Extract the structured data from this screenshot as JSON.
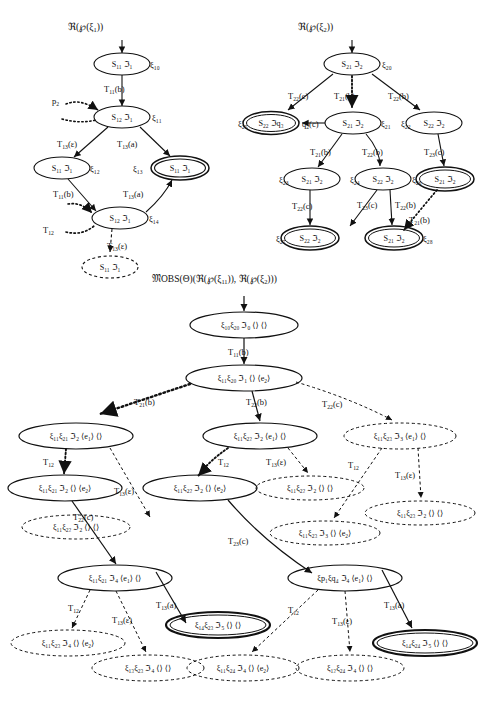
{
  "figure": {
    "kind": "three tree diagrams of labelled automaton states",
    "trees": [
      {
        "id": "tree-left",
        "title": "ℜ(℘(ξ1))",
        "nodes": [
          {
            "id": "L0",
            "text": "S11 ℑ1",
            "side": "ξ1₀",
            "style": "solid",
            "cx": 122,
            "cy": 64
          },
          {
            "id": "L1",
            "text": "S12 ℑ1",
            "side": "ξ1₁",
            "style": "solid",
            "cx": 122,
            "cy": 117
          },
          {
            "id": "L2",
            "text": "S11 ℑ1",
            "side": "ξ1₂",
            "style": "solid",
            "cx": 62,
            "cy": 168
          },
          {
            "id": "L3",
            "text": "S11 ℑ1",
            "side": "ξ1₃",
            "style": "double",
            "cx": 180,
            "cy": 168
          },
          {
            "id": "L4",
            "text": "S12 ℑ1",
            "side": "ξ1₄",
            "style": "solid",
            "cx": 120,
            "cy": 218
          },
          {
            "id": "L5",
            "text": "S11 ℑ1",
            "side": "",
            "style": "dashed",
            "cx": 110,
            "cy": 267
          }
        ],
        "edges": [
          {
            "from": "entry",
            "to": "L0",
            "label": "",
            "style": "solid"
          },
          {
            "from": "L0",
            "to": "L1",
            "label": "T11(b)",
            "style": "solid"
          },
          {
            "from": "L1",
            "to": "L2",
            "label": "T13(ε)",
            "style": "solid"
          },
          {
            "from": "L1",
            "to": "L3",
            "label": "T13(a)",
            "style": "solid"
          },
          {
            "from": "L2",
            "to": "L4",
            "label": "T11(b)",
            "style": "solid"
          },
          {
            "from": "L4",
            "to": "L3",
            "label": "T13(a)",
            "style": "solid"
          },
          {
            "from": "L4",
            "to": "L5",
            "label": "T13(ε)",
            "style": "dashed"
          },
          {
            "from": "p2",
            "to": "L1",
            "label": "p2",
            "style": "dotted"
          },
          {
            "from": "T12",
            "to": "L4",
            "label": "T12",
            "style": "dotted"
          }
        ]
      },
      {
        "id": "tree-right",
        "title": "ℜ(℘(ξ2))",
        "nodes": [
          {
            "id": "R0",
            "text": "S21 ℑ2",
            "side": "ξ2₀",
            "style": "solid",
            "cx": 352,
            "cy": 64
          },
          {
            "id": "R1",
            "text": "S22 ℑq₃",
            "side": "ξ2₅",
            "style": "double",
            "cx": 271,
            "cy": 123
          },
          {
            "id": "R2",
            "text": "S21 ℑ2",
            "side": "ξ2₁",
            "style": "solid",
            "cx": 353,
            "cy": 123
          },
          {
            "id": "R3",
            "text": "S22 ℑ2",
            "side": "ξ2₂",
            "style": "solid",
            "cx": 434,
            "cy": 123
          },
          {
            "id": "R4",
            "text": "S21 ℑ2",
            "side": "ξ2₃",
            "style": "solid",
            "cx": 312,
            "cy": 179
          },
          {
            "id": "R5",
            "text": "S22 ℑ2",
            "side": "ξ2₄",
            "style": "solid",
            "cx": 383,
            "cy": 179
          },
          {
            "id": "R6",
            "text": "S21 ℑ2",
            "side": "ξ2₆",
            "style": "double",
            "cx": 445,
            "cy": 179
          },
          {
            "id": "R7",
            "text": "S22 ℑ2",
            "side": "ξ2₇",
            "style": "double",
            "cx": 310,
            "cy": 238
          },
          {
            "id": "R8",
            "text": "S21 ℑ2",
            "side": "ξ2₈",
            "style": "double",
            "cx": 394,
            "cy": 238
          }
        ],
        "edges": [
          {
            "from": "entry",
            "to": "R0",
            "label": "",
            "style": "solid"
          },
          {
            "from": "R0",
            "to": "R1",
            "label": "T22(c)",
            "style": "solid"
          },
          {
            "from": "R0",
            "to": "R2",
            "label": "T21(b)",
            "style": "dotted"
          },
          {
            "from": "R0",
            "to": "R3",
            "label": "T22(b)",
            "style": "solid"
          },
          {
            "from": "R2",
            "to": "R1",
            "label": "q2(c)",
            "style": "solid"
          },
          {
            "from": "R2",
            "to": "R4",
            "label": "T21(b)",
            "style": "solid"
          },
          {
            "from": "R2",
            "to": "R5",
            "label": "T22(b)",
            "style": "solid"
          },
          {
            "from": "R3",
            "to": "R6",
            "label": "T23(c)",
            "style": "solid"
          },
          {
            "from": "R4",
            "to": "R7",
            "label": "T22(c)",
            "style": "solid"
          },
          {
            "from": "R5",
            "to": "R7",
            "label": "T23(c)",
            "style": "solid"
          },
          {
            "from": "R5",
            "to": "R8",
            "label": "T22(b)",
            "style": "solid"
          },
          {
            "from": "R6",
            "to": "R8",
            "label": "T21(b)",
            "style": "dotted"
          }
        ]
      },
      {
        "id": "tree-main",
        "title": "𝔐OBS(Θ)(ℜ(℘(ξ11)), ℜ(℘(ξ2)))",
        "nodes": [
          {
            "id": "M0",
            "text": "ξ1₀ξ2₀ ℑ0 ⟨⟩ ⟨⟩",
            "style": "solid",
            "cx": 244,
            "cy": 325
          },
          {
            "id": "M1",
            "text": "ξ1₁ξ2₀ ℑ1 ⟨⟩ ⟨e2⟩",
            "style": "solid",
            "cx": 244,
            "cy": 378
          },
          {
            "id": "M2",
            "text": "ξ1₁ξ2₁ ℑ2 ⟨e1⟩ ⟨⟩",
            "style": "solid",
            "cx": 76,
            "cy": 436
          },
          {
            "id": "M3",
            "text": "ξ1₁ξ2₂ ℑ2 ⟨e1⟩ ⟨⟩",
            "style": "solid",
            "cx": 260,
            "cy": 436
          },
          {
            "id": "M4",
            "text": "ξ1₁ξ2₃ ℑ3 ⟨e1⟩ ⟨⟩",
            "style": "dashed",
            "cx": 400,
            "cy": 436
          },
          {
            "id": "M5",
            "text": "ξ1₁ξ2₁ ℑ2 ⟨⟩ ⟨e2⟩",
            "style": "solid",
            "cx": 65,
            "cy": 488
          },
          {
            "id": "M6",
            "text": "ξ1₁ξ2₂ ℑ2 ⟨⟩ ⟨e2⟩",
            "style": "solid",
            "cx": 200,
            "cy": 488
          },
          {
            "id": "M7",
            "text": "ξ1₁ξ2₂ ℑ2 ⟨⟩ ⟨⟩",
            "style": "dashed",
            "cx": 310,
            "cy": 488
          },
          {
            "id": "M8",
            "text": "ξ1₁ξ2₂ ℑ2 ⟨⟩ ⟨⟩",
            "style": "dashed",
            "cx": 76,
            "cy": 527
          },
          {
            "id": "M9",
            "text": "ξ1₁ξ2₃ ℑ3 ⟨⟩ ⟨e2⟩",
            "style": "dashed",
            "cx": 325,
            "cy": 533
          },
          {
            "id": "M10",
            "text": "ξ1₁ξ2₃ ℑ2 ⟨⟩ ⟨⟩",
            "style": "dashed",
            "cx": 420,
            "cy": 513
          },
          {
            "id": "M11",
            "text": "ξ1₁ξ2₁ ℑ4 ⟨e1⟩ ⟨⟩",
            "style": "solid",
            "cx": 115,
            "cy": 578
          },
          {
            "id": "M12",
            "text": "ξp₁ξq₄ ℑ4 ⟨e1⟩ ⟨⟩",
            "style": "solid",
            "cx": 345,
            "cy": 578
          },
          {
            "id": "M13",
            "text": "ξ1₁ξ2₃ ℑ4 ⟨⟩ ⟨e2⟩",
            "style": "dashed",
            "cx": 68,
            "cy": 643
          },
          {
            "id": "M14",
            "text": "ξ1₃ξ2₃ ℑ4 ⟨⟩ ⟨⟩",
            "style": "dashed",
            "cx": 148,
            "cy": 668
          },
          {
            "id": "M15",
            "text": "ξ1₄ξ2₃ ℑ5 ⟨⟩ ⟨⟩",
            "style": "double",
            "cx": 218,
            "cy": 625
          },
          {
            "id": "M16",
            "text": "ξ1₁ξ2₄ ℑ4 ⟨⟩ ⟨e2⟩",
            "style": "dashed",
            "cx": 243,
            "cy": 668
          },
          {
            "id": "M17",
            "text": "ξ1₂ξ2₄ ℑ4 ⟨⟩ ⟨⟩",
            "style": "dashed",
            "cx": 350,
            "cy": 668
          },
          {
            "id": "M18",
            "text": "ξ1₄ξ2₄ ℑ5 ⟨⟩ ⟨⟩",
            "style": "double",
            "cx": 425,
            "cy": 643
          }
        ],
        "edges": [
          {
            "from": "entry",
            "to": "M0",
            "label": "",
            "style": "solid"
          },
          {
            "from": "M0",
            "to": "M1",
            "label": "T11(b)",
            "style": "solid"
          },
          {
            "from": "M1",
            "to": "M2",
            "label": "T21(b)",
            "style": "dotted"
          },
          {
            "from": "M1",
            "to": "M3",
            "label": "T22(b)",
            "style": "solid"
          },
          {
            "from": "M1",
            "to": "M4",
            "label": "T22(c)",
            "style": "dashed"
          },
          {
            "from": "M2",
            "to": "M5",
            "label": "T12",
            "style": "dotted"
          },
          {
            "from": "M2",
            "to": "M8",
            "label": "T13(ε)",
            "style": "dashed"
          },
          {
            "from": "M3",
            "to": "M6",
            "label": "T12",
            "style": "dotted"
          },
          {
            "from": "M3",
            "to": "M7",
            "label": "T13(ε)",
            "style": "dashed"
          },
          {
            "from": "M4",
            "to": "M9",
            "label": "T12",
            "style": "dashed"
          },
          {
            "from": "M4",
            "to": "M10",
            "label": "T13(ε)",
            "style": "dashed"
          },
          {
            "from": "M5",
            "to": "M11",
            "label": "T22(c)",
            "style": "solid"
          },
          {
            "from": "M6",
            "to": "M12",
            "label": "T23(c)",
            "style": "solid"
          },
          {
            "from": "M11",
            "to": "M13",
            "label": "T12",
            "style": "dashed"
          },
          {
            "from": "M11",
            "to": "M14",
            "label": "T13(ε)",
            "style": "dashed"
          },
          {
            "from": "M11",
            "to": "M15",
            "label": "T13(a)",
            "style": "solid"
          },
          {
            "from": "M12",
            "to": "M16",
            "label": "T12",
            "style": "dashed"
          },
          {
            "from": "M12",
            "to": "M17",
            "label": "T13(ε)",
            "style": "dashed"
          },
          {
            "from": "M12",
            "to": "M18",
            "label": "T13(a)",
            "style": "solid"
          }
        ]
      }
    ]
  },
  "labels": {
    "tree_left_title": "ℜ(℘(ξ1))",
    "tree_right_title": "ℜ(℘(ξ2))",
    "tree_main_title": "𝔐OBS(Θ)(ℜ(℘(ξ11)), ℜ(℘(ξ2)))"
  },
  "colors": {
    "ink": "#111111",
    "paper": "#ffffff"
  }
}
